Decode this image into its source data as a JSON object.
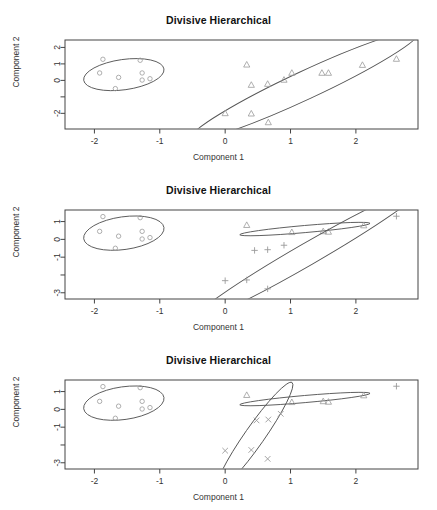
{
  "figure": {
    "width": 437,
    "height": 510,
    "background": "#ffffff",
    "panel_count": 3,
    "marker_color": "#9a9a9a",
    "ellipse_color": "#555555",
    "frame_color": "#444444",
    "text_color": "#333333"
  },
  "chart_data": [
    {
      "type": "scatter",
      "title": "Divisive Hierarchical",
      "xlabel": "Component 1",
      "ylabel": "Component 2",
      "xlim": [
        -2.45,
        2.95
      ],
      "ylim": [
        -2.95,
        2.45
      ],
      "xticks": [
        -2,
        -1,
        0,
        1,
        2
      ],
      "xticklabels": [
        "-2",
        "-1",
        "0",
        "1",
        "2"
      ],
      "yticks": [
        2,
        1,
        0,
        -1,
        -2
      ],
      "yticklabels": [
        "2",
        "1",
        "0",
        "",
        "-2"
      ],
      "grid": false,
      "legend": "none",
      "series": [
        {
          "name": "cluster-1",
          "marker": "circle",
          "points": [
            [
              -1.92,
              0.45
            ],
            [
              -1.63,
              0.18
            ],
            [
              -1.27,
              0.45
            ],
            [
              -1.27,
              0.02
            ],
            [
              -1.87,
              1.28
            ],
            [
              -1.3,
              1.22
            ],
            [
              -1.15,
              0.1
            ],
            [
              -1.68,
              -0.5
            ]
          ],
          "ellipse": {
            "cx": -1.55,
            "cy": 0.35,
            "rx": 0.62,
            "ry": 0.92,
            "angle": -8
          }
        },
        {
          "name": "cluster-2",
          "marker": "triangle",
          "points": [
            [
              0.33,
              0.95
            ],
            [
              0.4,
              -0.28
            ],
            [
              0.65,
              -0.22
            ],
            [
              0.9,
              0.03
            ],
            [
              1.02,
              0.45
            ],
            [
              1.48,
              0.45
            ],
            [
              1.58,
              0.45
            ],
            [
              2.1,
              0.93
            ],
            [
              0.0,
              -2.0
            ],
            [
              0.4,
              -2.02
            ],
            [
              0.66,
              -2.55
            ],
            [
              2.62,
              1.3
            ]
          ],
          "ellipse": {
            "cx": 1.22,
            "cy": -0.3,
            "rx": 1.92,
            "ry": 0.86,
            "angle": -25
          }
        }
      ]
    },
    {
      "type": "scatter",
      "title": "Divisive Hierarchical",
      "xlabel": "Component 1",
      "ylabel": "Component 2",
      "xlim": [
        -2.45,
        2.95
      ],
      "ylim": [
        -3.35,
        1.65
      ],
      "xticks": [
        -2,
        -1,
        0,
        1,
        2
      ],
      "xticklabels": [
        "-2",
        "-1",
        "0",
        "1",
        "2"
      ],
      "yticks": [
        1,
        0,
        -1,
        -2,
        -3
      ],
      "yticklabels": [
        "1",
        "0",
        "-1",
        "",
        "-3"
      ],
      "grid": false,
      "legend": "none",
      "series": [
        {
          "name": "cluster-1",
          "marker": "circle",
          "points": [
            [
              -1.92,
              0.45
            ],
            [
              -1.63,
              0.18
            ],
            [
              -1.27,
              0.45
            ],
            [
              -1.27,
              0.02
            ],
            [
              -1.87,
              1.28
            ],
            [
              -1.3,
              1.22
            ],
            [
              -1.15,
              0.1
            ],
            [
              -1.68,
              -0.5
            ]
          ],
          "ellipse": {
            "cx": -1.55,
            "cy": 0.35,
            "rx": 0.62,
            "ry": 0.92,
            "angle": -8
          }
        },
        {
          "name": "cluster-2",
          "marker": "triangle",
          "points": [
            [
              0.33,
              0.8
            ],
            [
              1.02,
              0.4
            ],
            [
              1.5,
              0.45
            ],
            [
              2.12,
              0.78
            ],
            [
              1.58,
              0.42
            ]
          ],
          "ellipse": {
            "cx": 1.22,
            "cy": 0.58,
            "rx": 1.0,
            "ry": 0.2,
            "angle": -5
          }
        },
        {
          "name": "cluster-3",
          "marker": "plus",
          "points": [
            [
              0.45,
              -0.62
            ],
            [
              0.65,
              -0.58
            ],
            [
              0.9,
              -0.33
            ],
            [
              0.33,
              -2.28
            ],
            [
              0.0,
              -2.32
            ],
            [
              0.65,
              -2.78
            ],
            [
              2.62,
              1.3
            ]
          ],
          "ellipse": {
            "cx": 1.25,
            "cy": -0.85,
            "rx": 2.05,
            "ry": 0.62,
            "angle": -30
          }
        }
      ]
    },
    {
      "type": "scatter",
      "title": "Divisive Hierarchical",
      "xlabel": "Component 1",
      "ylabel": "Component 2",
      "xlim": [
        -2.45,
        2.95
      ],
      "ylim": [
        -3.35,
        1.65
      ],
      "xticks": [
        -2,
        -1,
        0,
        1,
        2
      ],
      "xticklabels": [
        "-2",
        "-1",
        "0",
        "1",
        "2"
      ],
      "yticks": [
        1,
        0,
        -1,
        -2,
        -3
      ],
      "yticklabels": [
        "1",
        "0",
        "-1",
        "",
        "-3"
      ],
      "grid": false,
      "legend": "none",
      "series": [
        {
          "name": "cluster-1",
          "marker": "circle",
          "points": [
            [
              -1.92,
              0.45
            ],
            [
              -1.63,
              0.18
            ],
            [
              -1.27,
              0.45
            ],
            [
              -1.27,
              0.02
            ],
            [
              -1.87,
              1.28
            ],
            [
              -1.3,
              1.22
            ],
            [
              -1.15,
              0.1
            ],
            [
              -1.68,
              -0.5
            ]
          ],
          "ellipse": {
            "cx": -1.55,
            "cy": 0.35,
            "rx": 0.62,
            "ry": 0.92,
            "angle": -8
          }
        },
        {
          "name": "cluster-2",
          "marker": "triangle",
          "points": [
            [
              0.33,
              0.8
            ],
            [
              1.02,
              0.4
            ],
            [
              1.5,
              0.45
            ],
            [
              2.12,
              0.78
            ],
            [
              1.58,
              0.42
            ]
          ],
          "ellipse": {
            "cx": 1.22,
            "cy": 0.58,
            "rx": 1.0,
            "ry": 0.2,
            "angle": -5
          }
        },
        {
          "name": "cluster-3",
          "marker": "cross",
          "points": [
            [
              0.48,
              -0.62
            ],
            [
              0.66,
              -0.57
            ],
            [
              0.4,
              -2.28
            ],
            [
              0.85,
              -0.25
            ],
            [
              0.0,
              -2.32
            ],
            [
              0.65,
              -2.78
            ]
          ],
          "ellipse": {
            "cx": 0.45,
            "cy": -1.5,
            "rx": 1.0,
            "ry": 0.55,
            "angle": -55
          }
        },
        {
          "name": "cluster-4",
          "marker": "plus",
          "points": [
            [
              2.62,
              1.3
            ]
          ],
          "ellipse": null
        }
      ]
    }
  ]
}
